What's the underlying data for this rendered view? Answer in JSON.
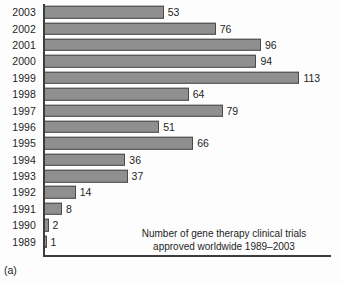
{
  "figure": {
    "panel_letter": "(a)",
    "caption_line1": "Number of gene therapy clinical trials",
    "caption_line2": "approved worldwide 1989–2003",
    "bar_color": "#8f8f8f",
    "bar_border_color": "#4a4a4a",
    "axis_color": "#3d3d3d",
    "background_color": "#fdfdfd"
  },
  "chart_data": {
    "type": "bar",
    "orientation": "horizontal",
    "title": "Number of gene therapy clinical trials approved worldwide 1989–2003",
    "xlabel": "",
    "ylabel": "",
    "xlim": [
      0,
      120
    ],
    "grid": false,
    "legend": "none",
    "data_labels": true,
    "categories": [
      "2003",
      "2002",
      "2001",
      "2000",
      "1999",
      "1998",
      "1997",
      "1996",
      "1995",
      "1994",
      "1993",
      "1992",
      "1991",
      "1990",
      "1989"
    ],
    "values": [
      53,
      76,
      96,
      94,
      113,
      64,
      79,
      51,
      66,
      36,
      37,
      14,
      8,
      2,
      1
    ],
    "rows": [
      {
        "year": "2003",
        "value": 53,
        "label": "53"
      },
      {
        "year": "2002",
        "value": 76,
        "label": "76"
      },
      {
        "year": "2001",
        "value": 96,
        "label": "96"
      },
      {
        "year": "2000",
        "value": 94,
        "label": "94"
      },
      {
        "year": "1999",
        "value": 113,
        "label": "113"
      },
      {
        "year": "1998",
        "value": 64,
        "label": "64"
      },
      {
        "year": "1997",
        "value": 79,
        "label": "79"
      },
      {
        "year": "1996",
        "value": 51,
        "label": "51"
      },
      {
        "year": "1995",
        "value": 66,
        "label": "66"
      },
      {
        "year": "1994",
        "value": 36,
        "label": "36"
      },
      {
        "year": "1993",
        "value": 37,
        "label": "37"
      },
      {
        "year": "1992",
        "value": 14,
        "label": "14"
      },
      {
        "year": "1991",
        "value": 8,
        "label": "8"
      },
      {
        "year": "1990",
        "value": 2,
        "label": "2"
      },
      {
        "year": "1989",
        "value": 1,
        "label": "1"
      }
    ]
  }
}
